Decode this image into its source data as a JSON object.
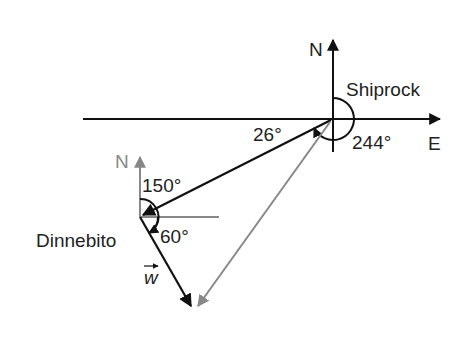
{
  "diagram": {
    "colors": {
      "primary": "#111111",
      "secondary": "#888888",
      "background": "#ffffff"
    },
    "shiprock": {
      "label": "Shiprock",
      "north_label": "N",
      "east_label": "E",
      "angle_label": "244°",
      "angle_26_label": "26°"
    },
    "dinnebito": {
      "label": "Dinnebito",
      "north_label": "N",
      "angle_150_label": "150°",
      "angle_60_label": "60°"
    },
    "vector": {
      "label": "w"
    }
  }
}
